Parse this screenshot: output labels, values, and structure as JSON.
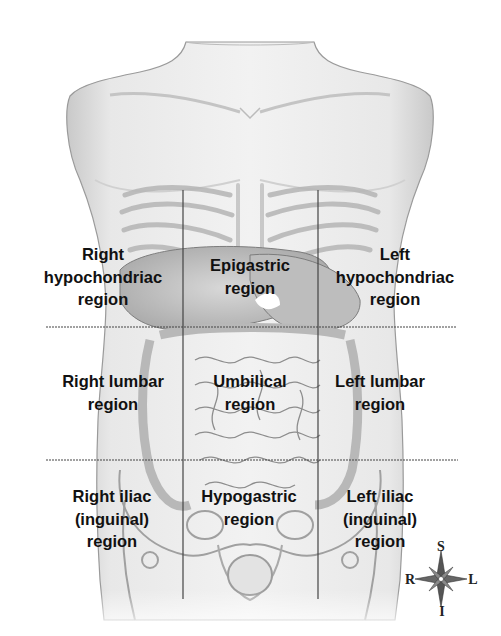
{
  "diagram": {
    "grid": {
      "vertical_lines_x": [
        183,
        318
      ],
      "vertical_lines_y_range": [
        190,
        599
      ],
      "horizontal_lines_y": [
        327,
        460
      ],
      "horizontal_lines_x_range": [
        46,
        457
      ],
      "line_color": "#444444"
    },
    "regions": [
      {
        "id": "right-hypochondriac",
        "lines": [
          "Right",
          "hypochondriac",
          "region"
        ]
      },
      {
        "id": "epigastric",
        "lines": [
          "Epigastric",
          "region"
        ]
      },
      {
        "id": "left-hypochondriac",
        "lines": [
          "Left",
          "hypochondriac",
          "region"
        ]
      },
      {
        "id": "right-lumbar",
        "lines": [
          "Right lumbar",
          "region"
        ]
      },
      {
        "id": "umbilical",
        "lines": [
          "Umbilical",
          "region"
        ]
      },
      {
        "id": "left-lumbar",
        "lines": [
          "Left lumbar",
          "region"
        ]
      },
      {
        "id": "right-iliac",
        "lines": [
          "Right iliac",
          "(inguinal)",
          "region"
        ]
      },
      {
        "id": "hypogastric",
        "lines": [
          "Hypogastric",
          "region"
        ]
      },
      {
        "id": "left-iliac",
        "lines": [
          "Left iliac",
          "(inguinal)",
          "region"
        ]
      }
    ],
    "compass": {
      "superior": "S",
      "inferior": "I",
      "right": "R",
      "left": "L"
    }
  }
}
